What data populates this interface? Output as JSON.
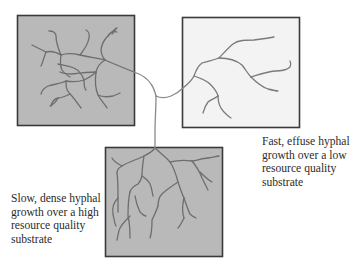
{
  "figure": {
    "type": "conceptual diagram of fungal hyphal growth across substrates",
    "colors": {
      "high_quality_box_fill": "#b9b9b9",
      "low_quality_box_fill": "#f3f3f3",
      "box_border": "#3a3a3a",
      "hypha_stroke": "#6e6e6e",
      "text": "#2b2b2b"
    },
    "boxes": [
      {
        "id": "top-left",
        "label": "High resource quality substrate (dense growth)",
        "fill": "shaded"
      },
      {
        "id": "top-right",
        "label": "Low resource quality substrate (effuse growth)",
        "fill": "light"
      },
      {
        "id": "bottom",
        "label": "High resource quality substrate (dense growth)",
        "fill": "shaded"
      }
    ],
    "captions": {
      "right": {
        "lines": [
          "Fast, effuse hyphal",
          "growth over a low",
          "resource quality",
          "substrate"
        ]
      },
      "left": {
        "lines": [
          "Slow, dense hyphal",
          "growth over a high",
          "resource quality",
          "substrate"
        ]
      }
    }
  }
}
